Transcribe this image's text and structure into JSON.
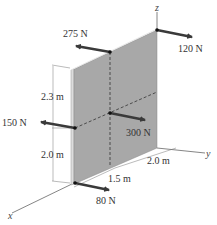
{
  "figure": {
    "type": "3D statics diagram",
    "panel_color": "#a8a8a8",
    "panel_edge_color": "#d9d9d9",
    "arrow_color": "#3a3a3a",
    "axes": {
      "x": "x",
      "y": "y",
      "z": "z"
    },
    "forces": [
      {
        "label": "275 N"
      },
      {
        "label": "120 N"
      },
      {
        "label": "150 N"
      },
      {
        "label": "300 N"
      },
      {
        "label": "80 N"
      }
    ],
    "dimensions": [
      {
        "label": "2.3 m"
      },
      {
        "label": "2.0 m"
      },
      {
        "label": "1.5 m"
      },
      {
        "label": "2.0 m"
      }
    ]
  }
}
